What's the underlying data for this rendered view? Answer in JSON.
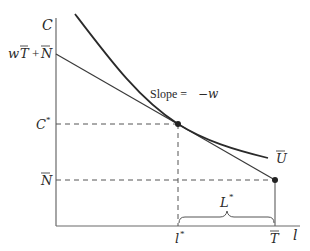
{
  "diagram": {
    "type": "labor-leisure choice (consumption vs leisure)",
    "axes": {
      "y_label": "C",
      "x_label": "l"
    },
    "y_ticks": [
      {
        "label_main": "w",
        "label_T": "T",
        "label_plus": "+",
        "label_N": "N",
        "text": "wT̄ + N̄"
      },
      {
        "label": "C",
        "sup": "*",
        "text": "C*"
      },
      {
        "label": "N",
        "text": "N̄"
      }
    ],
    "x_ticks": [
      {
        "label": "l",
        "sup": "*",
        "text": "l*"
      },
      {
        "label": "T",
        "text": "T̄"
      }
    ],
    "annotations": {
      "slope": "Slope = −w",
      "slope_prefix": "Slope = ",
      "slope_value": "−w",
      "indifference_curve": "U",
      "bracket_label": "L",
      "bracket_sup": "*"
    },
    "colors": {
      "line": "#3a3a3a",
      "curve": "#2a2a2a",
      "axis": "#6a6a6a",
      "dash": "#555555"
    }
  }
}
